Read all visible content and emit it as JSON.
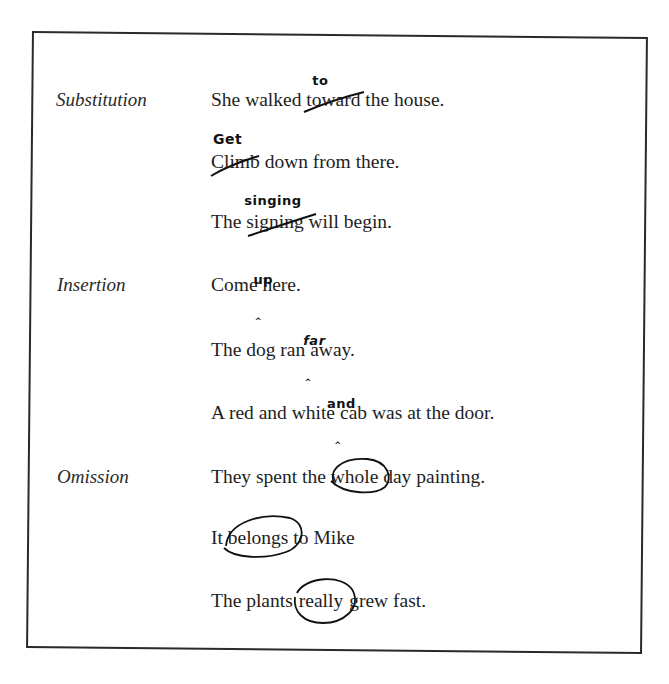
{
  "document": {
    "sections": [
      {
        "label": "Substitution",
        "examples": [
          {
            "before": "She walked ",
            "marked": "toward",
            "after": " the house.",
            "correction": "to",
            "mark_type": "strikethrough-replace"
          },
          {
            "before": "",
            "marked": "Climb",
            "after": " down from there.",
            "correction": "Get",
            "mark_type": "strikethrough-replace"
          },
          {
            "before": "The ",
            "marked": "signing",
            "after": " will begin.",
            "correction": "singing",
            "mark_type": "strikethrough-replace"
          }
        ]
      },
      {
        "label": "Insertion",
        "examples": [
          {
            "before": "Come",
            "after": " here.",
            "insertion": "up",
            "caret": "‸",
            "mark_type": "caret-insert"
          },
          {
            "before": "The dog ran",
            "after": "away.",
            "insertion": "far",
            "caret": "‸",
            "mark_type": "caret-insert"
          },
          {
            "before": "A red and white",
            "after": "cab was at the door.",
            "insertion": "and",
            "caret": "‸",
            "mark_type": "caret-insert"
          }
        ]
      },
      {
        "label": "Omission",
        "examples": [
          {
            "before": "They spent the ",
            "marked": "whole",
            "after": " day painting.",
            "mark_type": "circled-omission"
          },
          {
            "before": "It ",
            "marked": "belongs",
            "after": " to Mike",
            "mark_type": "circled-omission"
          },
          {
            "before": "The plants",
            "marked": "really",
            "after": "grew fast.",
            "mark_type": "circled-omission"
          }
        ]
      }
    ]
  }
}
